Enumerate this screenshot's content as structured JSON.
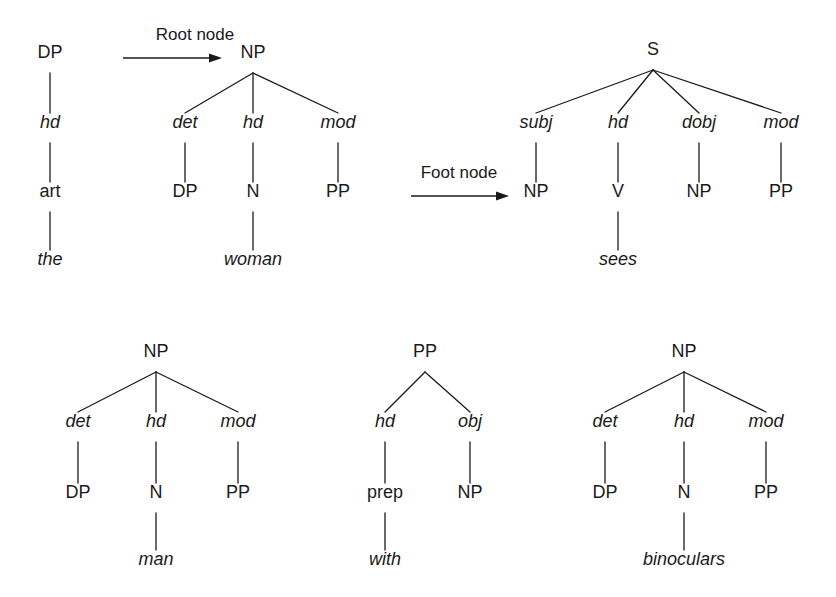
{
  "figure": {
    "background_color": "#ffffff",
    "ink_color": "#1a1a1a",
    "width": 836,
    "height": 597
  },
  "annotations": [
    {
      "id": "root-node",
      "label": "Root node",
      "label_x": 195,
      "label_y": 40,
      "arrow_x1": 123,
      "arrow_x2": 222,
      "arrow_y": 58,
      "points_to": "NP"
    },
    {
      "id": "foot-node",
      "label": "Foot node",
      "label_x": 459,
      "label_y": 178,
      "arrow_x1": 411,
      "arrow_x2": 509,
      "arrow_y": 196,
      "points_to": "NP"
    }
  ],
  "trees": [
    {
      "id": "tree-dp-the",
      "name": "DP elementary tree for 'the'",
      "nodes": [
        {
          "id": "dp-1",
          "label": "DP",
          "x": 50,
          "y": 58,
          "style": "upright"
        },
        {
          "id": "dp-2",
          "label": "hd",
          "x": 50,
          "y": 128,
          "style": "italic"
        },
        {
          "id": "dp-3",
          "label": "art",
          "x": 50,
          "y": 197,
          "style": "upright"
        },
        {
          "id": "dp-4",
          "label": "the",
          "x": 50,
          "y": 265,
          "style": "italic"
        }
      ],
      "edges": [
        {
          "from": "dp-1",
          "to": "dp-2"
        },
        {
          "from": "dp-2",
          "to": "dp-3"
        },
        {
          "from": "dp-3",
          "to": "dp-4"
        }
      ]
    },
    {
      "id": "tree-np-woman",
      "name": "NP elementary tree for 'woman'",
      "nodes": [
        {
          "id": "nw-root",
          "label": "NP",
          "x": 253,
          "y": 58,
          "style": "upright"
        },
        {
          "id": "nw-det",
          "label": "det",
          "x": 185,
          "y": 128,
          "style": "italic"
        },
        {
          "id": "nw-hd",
          "label": "hd",
          "x": 253,
          "y": 128,
          "style": "italic"
        },
        {
          "id": "nw-mod",
          "label": "mod",
          "x": 338,
          "y": 128,
          "style": "italic"
        },
        {
          "id": "nw-dp",
          "label": "DP",
          "x": 185,
          "y": 197,
          "style": "upright"
        },
        {
          "id": "nw-n",
          "label": "N",
          "x": 253,
          "y": 197,
          "style": "upright"
        },
        {
          "id": "nw-pp",
          "label": "PP",
          "x": 338,
          "y": 197,
          "style": "upright"
        },
        {
          "id": "nw-word",
          "label": "woman",
          "x": 253,
          "y": 265,
          "style": "italic"
        }
      ],
      "edges": [
        {
          "from": "nw-root",
          "to": "nw-det"
        },
        {
          "from": "nw-root",
          "to": "nw-hd"
        },
        {
          "from": "nw-root",
          "to": "nw-mod"
        },
        {
          "from": "nw-det",
          "to": "nw-dp"
        },
        {
          "from": "nw-hd",
          "to": "nw-n"
        },
        {
          "from": "nw-mod",
          "to": "nw-pp"
        },
        {
          "from": "nw-n",
          "to": "nw-word"
        }
      ]
    },
    {
      "id": "tree-s-sees",
      "name": "S elementary tree for 'sees'",
      "nodes": [
        {
          "id": "s-root",
          "label": "S",
          "x": 653,
          "y": 55,
          "style": "upright"
        },
        {
          "id": "s-subj",
          "label": "subj",
          "x": 536,
          "y": 128,
          "style": "italic"
        },
        {
          "id": "s-hd",
          "label": "hd",
          "x": 618,
          "y": 128,
          "style": "italic"
        },
        {
          "id": "s-dobj",
          "label": "dobj",
          "x": 699,
          "y": 128,
          "style": "italic"
        },
        {
          "id": "s-mod",
          "label": "mod",
          "x": 781,
          "y": 128,
          "style": "italic"
        },
        {
          "id": "s-np1",
          "label": "NP",
          "x": 536,
          "y": 197,
          "style": "upright"
        },
        {
          "id": "s-v",
          "label": "V",
          "x": 618,
          "y": 197,
          "style": "upright"
        },
        {
          "id": "s-np2",
          "label": "NP",
          "x": 699,
          "y": 197,
          "style": "upright"
        },
        {
          "id": "s-pp",
          "label": "PP",
          "x": 781,
          "y": 197,
          "style": "upright"
        },
        {
          "id": "s-word",
          "label": "sees",
          "x": 618,
          "y": 265,
          "style": "italic"
        }
      ],
      "edges": [
        {
          "from": "s-root",
          "to": "s-subj"
        },
        {
          "from": "s-root",
          "to": "s-hd"
        },
        {
          "from": "s-root",
          "to": "s-dobj"
        },
        {
          "from": "s-root",
          "to": "s-mod"
        },
        {
          "from": "s-subj",
          "to": "s-np1"
        },
        {
          "from": "s-hd",
          "to": "s-v"
        },
        {
          "from": "s-dobj",
          "to": "s-np2"
        },
        {
          "from": "s-mod",
          "to": "s-pp"
        },
        {
          "from": "s-v",
          "to": "s-word"
        }
      ]
    },
    {
      "id": "tree-np-man",
      "name": "NP elementary tree for 'man'",
      "nodes": [
        {
          "id": "nm-root",
          "label": "NP",
          "x": 156,
          "y": 357,
          "style": "upright"
        },
        {
          "id": "nm-det",
          "label": "det",
          "x": 78,
          "y": 427,
          "style": "italic"
        },
        {
          "id": "nm-hd",
          "label": "hd",
          "x": 156,
          "y": 427,
          "style": "italic"
        },
        {
          "id": "nm-mod",
          "label": "mod",
          "x": 238,
          "y": 427,
          "style": "italic"
        },
        {
          "id": "nm-dp",
          "label": "DP",
          "x": 78,
          "y": 498,
          "style": "upright"
        },
        {
          "id": "nm-n",
          "label": "N",
          "x": 156,
          "y": 498,
          "style": "upright"
        },
        {
          "id": "nm-pp",
          "label": "PP",
          "x": 238,
          "y": 498,
          "style": "upright"
        },
        {
          "id": "nm-word",
          "label": "man",
          "x": 156,
          "y": 565,
          "style": "italic"
        }
      ],
      "edges": [
        {
          "from": "nm-root",
          "to": "nm-det"
        },
        {
          "from": "nm-root",
          "to": "nm-hd"
        },
        {
          "from": "nm-root",
          "to": "nm-mod"
        },
        {
          "from": "nm-det",
          "to": "nm-dp"
        },
        {
          "from": "nm-hd",
          "to": "nm-n"
        },
        {
          "from": "nm-mod",
          "to": "nm-pp"
        },
        {
          "from": "nm-n",
          "to": "nm-word"
        }
      ]
    },
    {
      "id": "tree-pp-with",
      "name": "PP elementary tree for 'with'",
      "nodes": [
        {
          "id": "pw-root",
          "label": "PP",
          "x": 425,
          "y": 357,
          "style": "upright"
        },
        {
          "id": "pw-hd",
          "label": "hd",
          "x": 385,
          "y": 427,
          "style": "italic"
        },
        {
          "id": "pw-obj",
          "label": "obj",
          "x": 470,
          "y": 427,
          "style": "italic"
        },
        {
          "id": "pw-prep",
          "label": "prep",
          "x": 385,
          "y": 498,
          "style": "upright"
        },
        {
          "id": "pw-np",
          "label": "NP",
          "x": 470,
          "y": 498,
          "style": "upright"
        },
        {
          "id": "pw-word",
          "label": "with",
          "x": 385,
          "y": 565,
          "style": "italic"
        }
      ],
      "edges": [
        {
          "from": "pw-root",
          "to": "pw-hd"
        },
        {
          "from": "pw-root",
          "to": "pw-obj"
        },
        {
          "from": "pw-hd",
          "to": "pw-prep"
        },
        {
          "from": "pw-obj",
          "to": "pw-np"
        },
        {
          "from": "pw-prep",
          "to": "pw-word"
        }
      ]
    },
    {
      "id": "tree-np-binoculars",
      "name": "NP elementary tree for 'binoculars'",
      "nodes": [
        {
          "id": "nb-root",
          "label": "NP",
          "x": 684,
          "y": 357,
          "style": "upright"
        },
        {
          "id": "nb-det",
          "label": "det",
          "x": 605,
          "y": 427,
          "style": "italic"
        },
        {
          "id": "nb-hd",
          "label": "hd",
          "x": 684,
          "y": 427,
          "style": "italic"
        },
        {
          "id": "nb-mod",
          "label": "mod",
          "x": 766,
          "y": 427,
          "style": "italic"
        },
        {
          "id": "nb-dp",
          "label": "DP",
          "x": 605,
          "y": 498,
          "style": "upright"
        },
        {
          "id": "nb-n",
          "label": "N",
          "x": 684,
          "y": 498,
          "style": "upright"
        },
        {
          "id": "nb-pp",
          "label": "PP",
          "x": 766,
          "y": 498,
          "style": "upright"
        },
        {
          "id": "nb-word",
          "label": "binoculars",
          "x": 684,
          "y": 565,
          "style": "italic"
        }
      ],
      "edges": [
        {
          "from": "nb-root",
          "to": "nb-det"
        },
        {
          "from": "nb-root",
          "to": "nb-hd"
        },
        {
          "from": "nb-root",
          "to": "nb-mod"
        },
        {
          "from": "nb-det",
          "to": "nb-dp"
        },
        {
          "from": "nb-hd",
          "to": "nb-n"
        },
        {
          "from": "nb-mod",
          "to": "nb-pp"
        },
        {
          "from": "nb-n",
          "to": "nb-word"
        }
      ]
    }
  ]
}
